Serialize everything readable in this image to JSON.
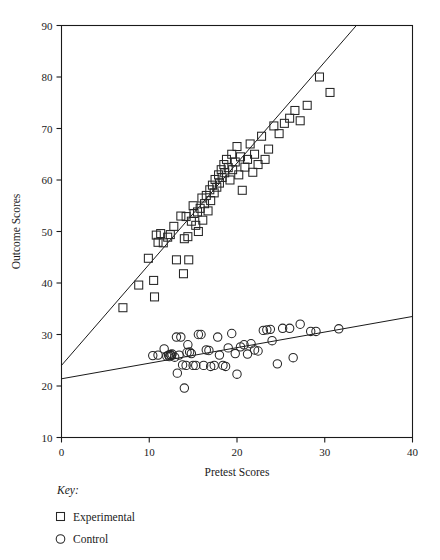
{
  "chart_data": {
    "type": "scatter",
    "title": "",
    "xlabel": "Pretest Scores",
    "ylabel": "Outcome Scores",
    "xlim": [
      0,
      40
    ],
    "ylim": [
      10,
      90
    ],
    "xticks": [
      0,
      10,
      20,
      30,
      40
    ],
    "yticks": [
      10,
      20,
      30,
      40,
      50,
      60,
      70,
      80,
      90
    ],
    "grid": false,
    "frame": "full-box",
    "legend": {
      "position": "below-axes-left",
      "title": "Key:",
      "entries": [
        {
          "marker": "square",
          "label": "Experimental"
        },
        {
          "marker": "circle",
          "label": "Control"
        }
      ]
    },
    "series": [
      {
        "name": "Experimental",
        "marker": "square",
        "points": [
          [
            7.0,
            35.2
          ],
          [
            8.8,
            39.6
          ],
          [
            9.9,
            44.8
          ],
          [
            10.5,
            40.5
          ],
          [
            10.6,
            37.3
          ],
          [
            10.8,
            49.3
          ],
          [
            11.0,
            47.9
          ],
          [
            11.3,
            49.6
          ],
          [
            11.6,
            47.8
          ],
          [
            12.1,
            48.9
          ],
          [
            12.4,
            49.4
          ],
          [
            12.8,
            51.0
          ],
          [
            13.1,
            44.5
          ],
          [
            13.6,
            53.0
          ],
          [
            13.9,
            41.8
          ],
          [
            14.0,
            48.6
          ],
          [
            14.2,
            52.9
          ],
          [
            14.4,
            49.0
          ],
          [
            14.5,
            44.5
          ],
          [
            14.8,
            52.0
          ],
          [
            15.0,
            55.0
          ],
          [
            15.1,
            53.5
          ],
          [
            15.3,
            51.2
          ],
          [
            15.5,
            53.8
          ],
          [
            15.6,
            50.0
          ],
          [
            15.8,
            54.5
          ],
          [
            16.0,
            56.5
          ],
          [
            16.1,
            52.2
          ],
          [
            16.3,
            55.4
          ],
          [
            16.5,
            57.0
          ],
          [
            16.7,
            54.0
          ],
          [
            16.9,
            58.1
          ],
          [
            17.0,
            56.0
          ],
          [
            17.2,
            59.0
          ],
          [
            17.4,
            57.5
          ],
          [
            17.5,
            60.1
          ],
          [
            17.7,
            58.6
          ],
          [
            17.9,
            61.0
          ],
          [
            18.0,
            59.4
          ],
          [
            18.2,
            62.0
          ],
          [
            18.3,
            60.5
          ],
          [
            18.5,
            63.0
          ],
          [
            18.6,
            61.4
          ],
          [
            18.8,
            64.0
          ],
          [
            19.0,
            62.4
          ],
          [
            19.2,
            60.0
          ],
          [
            19.4,
            65.0
          ],
          [
            19.5,
            62.0
          ],
          [
            19.8,
            63.5
          ],
          [
            20.0,
            66.5
          ],
          [
            20.2,
            61.0
          ],
          [
            20.4,
            64.5
          ],
          [
            20.6,
            58.0
          ],
          [
            20.9,
            62.5
          ],
          [
            21.2,
            64.0
          ],
          [
            21.5,
            67.0
          ],
          [
            21.8,
            61.5
          ],
          [
            22.0,
            65.0
          ],
          [
            22.4,
            63.0
          ],
          [
            22.8,
            68.5
          ],
          [
            23.2,
            64.0
          ],
          [
            23.6,
            66.0
          ],
          [
            24.2,
            70.5
          ],
          [
            24.8,
            69.0
          ],
          [
            25.4,
            71.0
          ],
          [
            26.0,
            72.0
          ],
          [
            26.6,
            73.5
          ],
          [
            27.2,
            71.5
          ],
          [
            28.0,
            74.5
          ],
          [
            29.4,
            80.0
          ],
          [
            30.6,
            77.0
          ]
        ]
      },
      {
        "name": "Control",
        "marker": "circle",
        "points": [
          [
            10.4,
            25.9
          ],
          [
            11.0,
            26.0
          ],
          [
            11.7,
            27.2
          ],
          [
            12.0,
            25.8
          ],
          [
            12.2,
            26.0
          ],
          [
            12.3,
            25.7
          ],
          [
            12.4,
            26.1
          ],
          [
            12.5,
            25.9
          ],
          [
            12.6,
            26.2
          ],
          [
            12.9,
            25.6
          ],
          [
            13.1,
            29.5
          ],
          [
            13.6,
            29.5
          ],
          [
            13.2,
            22.5
          ],
          [
            13.4,
            26.0
          ],
          [
            13.8,
            24.1
          ],
          [
            14.0,
            19.6
          ],
          [
            14.2,
            24.0
          ],
          [
            14.3,
            26.5
          ],
          [
            14.4,
            28.0
          ],
          [
            14.6,
            26.6
          ],
          [
            14.8,
            26.3
          ],
          [
            15.0,
            24.0
          ],
          [
            15.3,
            24.0
          ],
          [
            15.6,
            30.0
          ],
          [
            15.9,
            30.0
          ],
          [
            16.2,
            24.0
          ],
          [
            16.5,
            27.0
          ],
          [
            16.8,
            26.9
          ],
          [
            17.0,
            23.8
          ],
          [
            17.4,
            24.0
          ],
          [
            17.8,
            29.5
          ],
          [
            18.0,
            26.0
          ],
          [
            18.4,
            24.0
          ],
          [
            18.7,
            23.8
          ],
          [
            19.0,
            27.4
          ],
          [
            19.4,
            30.2
          ],
          [
            19.8,
            26.3
          ],
          [
            20.0,
            22.3
          ],
          [
            20.4,
            27.6
          ],
          [
            20.8,
            28.0
          ],
          [
            21.2,
            26.2
          ],
          [
            21.6,
            28.2
          ],
          [
            22.0,
            27.0
          ],
          [
            22.4,
            26.8
          ],
          [
            23.0,
            30.8
          ],
          [
            23.4,
            30.9
          ],
          [
            23.8,
            31.0
          ],
          [
            24.0,
            28.8
          ],
          [
            24.6,
            24.3
          ],
          [
            25.2,
            31.2
          ],
          [
            26.0,
            31.2
          ],
          [
            26.4,
            25.5
          ],
          [
            27.2,
            32.0
          ],
          [
            28.4,
            30.6
          ],
          [
            29.0,
            30.6
          ],
          [
            31.6,
            31.1
          ]
        ]
      }
    ],
    "fit_lines": [
      {
        "name": "Experimental regression",
        "for_series": "Experimental",
        "x0": 0.0,
        "y0": 24.0,
        "x1": 33.6,
        "y1": 90.0,
        "intercept": 24.0,
        "slope": 1.964
      },
      {
        "name": "Control regression",
        "for_series": "Control",
        "x0": 0.0,
        "y0": 21.4,
        "x1": 40.0,
        "y1": 33.5,
        "intercept": 21.4,
        "slope": 0.3025
      }
    ]
  }
}
